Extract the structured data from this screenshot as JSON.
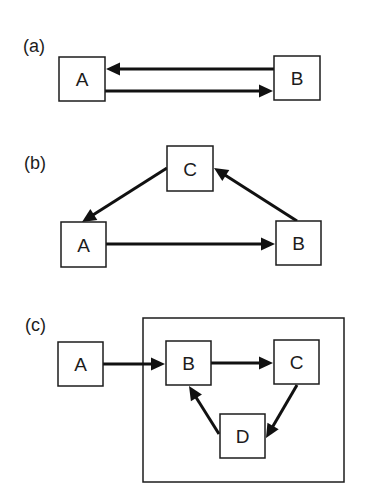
{
  "figure": {
    "width": 373,
    "height": 496,
    "colors": {
      "ink": "#1c1c1c",
      "arrow": "#111111",
      "background": "#ffffff"
    }
  },
  "panels": [
    {
      "id": "a",
      "label": "(a)",
      "label_pos": [
        23,
        52
      ],
      "nodes": [
        {
          "id": "A",
          "label": "A",
          "x": 59,
          "y": 57,
          "w": 46,
          "h": 44
        },
        {
          "id": "B",
          "label": "B",
          "x": 274,
          "y": 56,
          "w": 46,
          "h": 44
        }
      ],
      "edges": [
        {
          "from": "B",
          "to": "A",
          "x1": 274,
          "y1": 69,
          "x2": 106,
          "y2": 69
        },
        {
          "from": "A",
          "to": "B",
          "x1": 105,
          "y1": 91,
          "x2": 273,
          "y2": 91
        }
      ],
      "frames": []
    },
    {
      "id": "b",
      "label": "(b)",
      "label_pos": [
        24,
        169
      ],
      "nodes": [
        {
          "id": "C",
          "label": "C",
          "x": 167,
          "y": 146,
          "w": 46,
          "h": 45
        },
        {
          "id": "A",
          "label": "A",
          "x": 61,
          "y": 222,
          "w": 45,
          "h": 45
        },
        {
          "id": "B",
          "label": "B",
          "x": 276,
          "y": 221,
          "w": 45,
          "h": 44
        }
      ],
      "edges": [
        {
          "from": "C",
          "to": "A",
          "x1": 167,
          "y1": 168,
          "x2": 82,
          "y2": 222
        },
        {
          "from": "A",
          "to": "B",
          "x1": 106,
          "y1": 244,
          "x2": 275,
          "y2": 244
        },
        {
          "from": "B",
          "to": "C",
          "x1": 297,
          "y1": 221,
          "x2": 214,
          "y2": 168
        }
      ],
      "frames": []
    },
    {
      "id": "c",
      "label": "(c)",
      "label_pos": [
        25,
        331
      ],
      "nodes": [
        {
          "id": "A",
          "label": "A",
          "x": 58,
          "y": 342,
          "w": 45,
          "h": 44
        },
        {
          "id": "B",
          "label": "B",
          "x": 166,
          "y": 341,
          "w": 45,
          "h": 44
        },
        {
          "id": "C",
          "label": "C",
          "x": 274,
          "y": 340,
          "w": 45,
          "h": 44
        },
        {
          "id": "D",
          "label": "D",
          "x": 220,
          "y": 414,
          "w": 45,
          "h": 44
        }
      ],
      "edges": [
        {
          "from": "A",
          "to": "B",
          "x1": 103,
          "y1": 364,
          "x2": 165,
          "y2": 364
        },
        {
          "from": "B",
          "to": "C",
          "x1": 211,
          "y1": 363,
          "x2": 273,
          "y2": 363
        },
        {
          "from": "C",
          "to": "D",
          "x1": 297,
          "y1": 385,
          "x2": 266,
          "y2": 438
        },
        {
          "from": "D",
          "to": "B",
          "x1": 219,
          "y1": 434,
          "x2": 189,
          "y2": 386
        }
      ],
      "frames": [
        {
          "x": 143,
          "y": 318,
          "w": 201,
          "h": 164
        }
      ]
    }
  ]
}
